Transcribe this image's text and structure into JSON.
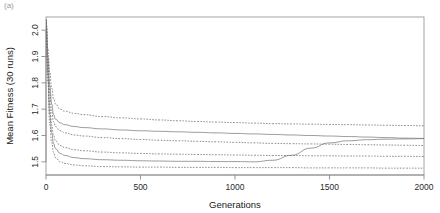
{
  "figure": {
    "panel_label": "(a)",
    "width": 440,
    "height": 213
  },
  "chart_data": {
    "type": "line",
    "title": "",
    "subtitle": "",
    "xlabel": "Generations",
    "ylabel": "Mean Fitness (30 runs)",
    "xlim": [
      0,
      2000
    ],
    "ylim": [
      1.45,
      2.05
    ],
    "xticks": [
      0,
      500,
      1000,
      1500,
      2000
    ],
    "xticklabels": [
      "0",
      "500",
      "1000",
      "1500",
      "2000"
    ],
    "yticks": [
      1.5,
      1.6,
      1.7,
      1.8,
      1.9,
      2.0
    ],
    "yticklabels": [
      "1.5",
      "1.6",
      "1.7",
      "1.8",
      "1.9",
      "2.0"
    ],
    "grid": false,
    "legend": "none",
    "frame": true,
    "x": [
      0,
      10,
      20,
      30,
      40,
      50,
      75,
      100,
      150,
      200,
      300,
      400,
      500,
      600,
      700,
      800,
      900,
      1000,
      1100,
      1200,
      1300,
      1400,
      1500,
      1600,
      1700,
      1800,
      1900,
      2000
    ],
    "series": [
      {
        "name": "run-group-1",
        "style": "dashed",
        "values": [
          2.04,
          1.93,
          1.84,
          1.78,
          1.74,
          1.72,
          1.7,
          1.692,
          1.684,
          1.679,
          1.672,
          1.667,
          1.663,
          1.659,
          1.656,
          1.653,
          1.651,
          1.649,
          1.647,
          1.645,
          1.644,
          1.643,
          1.642,
          1.641,
          1.64,
          1.639,
          1.638,
          1.637
        ]
      },
      {
        "name": "run-group-2",
        "style": "solid",
        "values": [
          2.04,
          1.9,
          1.79,
          1.72,
          1.68,
          1.662,
          1.648,
          1.641,
          1.634,
          1.63,
          1.625,
          1.621,
          1.618,
          1.616,
          1.614,
          1.612,
          1.61,
          1.608,
          1.606,
          1.604,
          1.602,
          1.6,
          1.598,
          1.596,
          1.594,
          1.592,
          1.59,
          1.589
        ]
      },
      {
        "name": "run-group-3",
        "style": "dashed",
        "values": [
          2.04,
          1.88,
          1.76,
          1.69,
          1.652,
          1.634,
          1.618,
          1.61,
          1.602,
          1.598,
          1.592,
          1.588,
          1.585,
          1.582,
          1.58,
          1.578,
          1.576,
          1.574,
          1.572,
          1.57,
          1.569,
          1.568,
          1.567,
          1.566,
          1.565,
          1.564,
          1.563,
          1.562
        ]
      },
      {
        "name": "run-group-4",
        "style": "dashed",
        "values": [
          2.04,
          1.85,
          1.71,
          1.64,
          1.6,
          1.58,
          1.562,
          1.554,
          1.546,
          1.542,
          1.537,
          1.534,
          1.532,
          1.53,
          1.529,
          1.528,
          1.527,
          1.526,
          1.525,
          1.524,
          1.524,
          1.523,
          1.523,
          1.522,
          1.522,
          1.521,
          1.521,
          1.52
        ]
      },
      {
        "name": "run-group-5",
        "style": "solid",
        "values": [
          2.04,
          1.83,
          1.68,
          1.61,
          1.57,
          1.55,
          1.532,
          1.524,
          1.516,
          1.512,
          1.508,
          1.506,
          1.504,
          1.503,
          1.502,
          1.502,
          1.501,
          1.501,
          1.5,
          1.506,
          1.525,
          1.552,
          1.572,
          1.58,
          1.584,
          1.586,
          1.587,
          1.588
        ]
      },
      {
        "name": "run-group-6",
        "style": "dashed",
        "values": [
          2.04,
          1.8,
          1.64,
          1.575,
          1.535,
          1.516,
          1.5,
          1.494,
          1.488,
          1.485,
          1.482,
          1.481,
          1.48,
          1.48,
          1.479,
          1.479,
          1.479,
          1.478,
          1.478,
          1.478,
          1.478,
          1.477,
          1.477,
          1.477,
          1.477,
          1.476,
          1.476,
          1.476
        ]
      }
    ]
  }
}
